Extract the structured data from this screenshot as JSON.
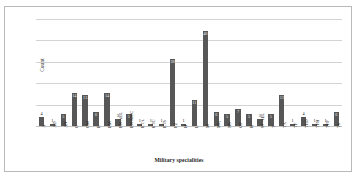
{
  "chart_data": {
    "type": "bar",
    "title": "",
    "xlabel": "Military specialities",
    "ylabel": "Count",
    "ylim": [
      0,
      45
    ],
    "grid": true,
    "gridlines": [
      0,
      9,
      18,
      27,
      36,
      45
    ],
    "legend": "none",
    "bar_color": "#575757",
    "categories": [
      "A",
      "AD",
      "AN",
      "C",
      "CM",
      "E",
      "EM",
      "EN AEL",
      "EN MEC",
      "ETA",
      "ETC",
      "ETS",
      "FZ",
      "H",
      "L",
      "M",
      "MQ",
      "NS",
      "OP",
      "R",
      "ST AEL",
      "T",
      "TA",
      "TF",
      "TFD",
      "TFH",
      "TFP",
      "TS"
    ],
    "values": [
      4,
      1,
      5,
      14,
      13,
      6,
      14,
      3,
      5,
      1,
      1,
      1,
      28,
      1,
      11,
      40,
      6,
      5,
      7,
      5,
      3,
      5,
      13,
      1,
      4,
      1,
      1,
      6
    ],
    "value_labels": [
      "4",
      "1",
      "5",
      "14",
      "13",
      "6",
      "14",
      "3",
      "5",
      "1",
      "1",
      "1",
      "28",
      "1",
      "11",
      "40",
      "6",
      "5",
      "7",
      "5",
      "3",
      "5",
      "13",
      "1",
      "4",
      "1",
      "1",
      "6"
    ]
  },
  "axis": {
    "y_title": "Count",
    "x_title": "Military specialities"
  }
}
